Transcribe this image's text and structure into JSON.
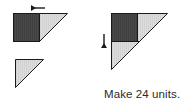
{
  "figure": {
    "caption": "Make 24 units.",
    "colors": {
      "dark_fabric": "#4a4a4a",
      "light_fabric": "#dcdcdc",
      "outline": "#1a1a1a",
      "arrow": "#1a1a1a",
      "background": "#ffffff",
      "caption_text": "#2b2b2b"
    },
    "pieces": {
      "left_top_unit": {
        "label": "dark rectangle joined to light triangle",
        "dark_rect": "dark shaded rectangle",
        "light_triangle": "light shaded triangle"
      },
      "left_bottom_unit": {
        "label": "light triangle",
        "light_triangle": "light shaded triangle"
      },
      "right_unit": {
        "label": "assembled triangle unit with dark square in corner",
        "dark_square": "dark shaded square",
        "light_triangle_upper": "light shaded triangle",
        "light_triangle_lower": "light shaded triangle"
      }
    },
    "arrows": {
      "top_left_arrow": "left-pointing-arrow",
      "middle_down_arrow": "down-pointing-arrow"
    }
  }
}
